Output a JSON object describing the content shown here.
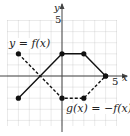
{
  "chart_data": {
    "type": "line",
    "title": "",
    "xlabel": "x",
    "ylabel": "y",
    "xlim": [
      -5,
      5
    ],
    "ylim": [
      -5,
      5
    ],
    "grid": true,
    "tick_labels": {
      "x": [
        "5"
      ],
      "y": [
        "5"
      ]
    },
    "series": [
      {
        "name": "y = f(x)",
        "style": "solid",
        "points": [
          [
            -4,
            -2
          ],
          [
            0,
            2
          ],
          [
            2,
            2
          ],
          [
            4,
            0
          ]
        ]
      },
      {
        "name": "g(x) = −f(x)",
        "style": "dashed",
        "points": [
          [
            -4,
            2
          ],
          [
            0,
            -2
          ],
          [
            2,
            -2
          ],
          [
            4,
            0
          ]
        ]
      }
    ],
    "annotations": [
      "y = f(x)",
      "g(x) = −f(x)"
    ]
  },
  "labels": {
    "x_axis": "x",
    "y_axis": "y",
    "x_tick": "5",
    "y_tick": "5",
    "f_label": "y = f(x)",
    "g_label": "g(x) = −f(x)"
  },
  "colors": {
    "line": "#111111",
    "grid": "#bbbbbb",
    "axis": "#444444"
  }
}
